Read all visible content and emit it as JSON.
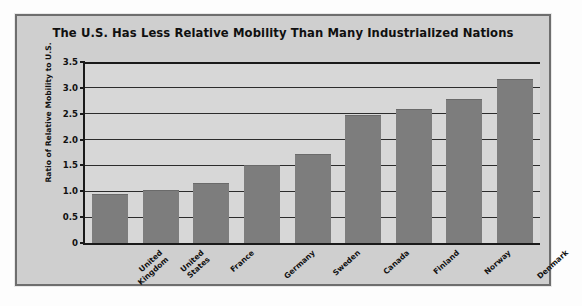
{
  "chart_data": {
    "type": "bar",
    "title": "The U.S. Has Less Relative Mobility Than Many Industrialized Nations",
    "xlabel": "",
    "ylabel": "Ratio of Relative Mobility to U.S.",
    "categories": [
      "United Kingdom",
      "United States",
      "France",
      "Germany",
      "Sweden",
      "Canada",
      "Finland",
      "Norway",
      "Denmark"
    ],
    "category_lines": [
      [
        "United",
        "Kingdom"
      ],
      [
        "United",
        "States"
      ],
      [
        "France"
      ],
      [
        "Germany"
      ],
      [
        "Sweden"
      ],
      [
        "Canada"
      ],
      [
        "Finland"
      ],
      [
        "Norway"
      ],
      [
        "Denmark"
      ]
    ],
    "values": [
      0.95,
      1.02,
      1.17,
      1.5,
      1.72,
      2.47,
      2.6,
      2.78,
      3.17
    ],
    "ylim": [
      0,
      3.5
    ],
    "yticks": [
      0,
      0.5,
      1.0,
      1.5,
      2.0,
      2.5,
      3.0,
      3.5
    ],
    "ytick_labels": [
      "0",
      "0.5",
      "1.0",
      "1.5",
      "2.0",
      "2.5",
      "3.0",
      "3.5"
    ],
    "grid": true,
    "legend": "none",
    "bar_color": "#7d7d7d",
    "plot_background": "#d7d7d7",
    "panel_background": "#cfcfcf",
    "axis_color": "#1a1a1a"
  }
}
